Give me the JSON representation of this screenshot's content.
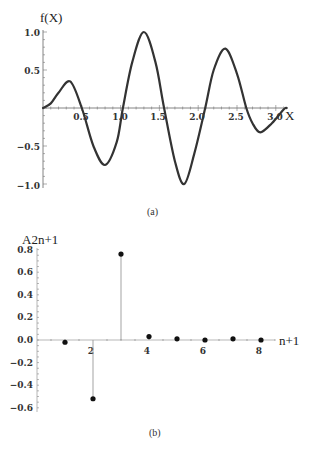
{
  "chart_data": [
    {
      "type": "line",
      "panel": "(a)",
      "title": "",
      "ylabel": "f(X)",
      "xlabel": "X",
      "xlim": [
        0,
        3.14
      ],
      "ylim": [
        -1.0,
        1.0
      ],
      "xticks": [
        "0.5",
        "1.0",
        "1.5",
        "2.0",
        "2.5",
        "3.0"
      ],
      "yticks": [
        "1.0",
        "0.5",
        "-0.5",
        "-1.0"
      ],
      "grid": false,
      "series": [
        {
          "name": "f(X)",
          "x": [
            0,
            0.1,
            0.2,
            0.35,
            0.5,
            0.65,
            0.8,
            0.95,
            1.03,
            1.15,
            1.3,
            1.45,
            1.56,
            1.7,
            1.82,
            1.95,
            2.09,
            2.2,
            2.35,
            2.5,
            2.62,
            2.7,
            2.8,
            2.95,
            3.1,
            3.14
          ],
          "y": [
            0,
            0.06,
            0.2,
            0.35,
            0.0,
            -0.5,
            -0.75,
            -0.45,
            0.0,
            0.6,
            1.0,
            0.6,
            0.0,
            -0.7,
            -1.0,
            -0.6,
            0.0,
            0.5,
            0.78,
            0.45,
            0.0,
            -0.2,
            -0.32,
            -0.2,
            -0.02,
            0.0
          ]
        }
      ]
    },
    {
      "type": "scatter",
      "style": "stem",
      "panel": "(b)",
      "title": "",
      "ylabel": "A2n+1",
      "xlabel": "n+1",
      "xlim": [
        0,
        9
      ],
      "ylim": [
        -0.6,
        0.8
      ],
      "xticks": [
        "2",
        "4",
        "6",
        "8"
      ],
      "yticks": [
        "0.8",
        "0.6",
        "0.4",
        "0.2",
        "0.0",
        "-0.2",
        "-0.4",
        "-0.6"
      ],
      "grid": false,
      "series": [
        {
          "name": "A2n+1",
          "x": [
            1,
            2,
            3,
            4,
            5,
            6,
            7,
            8
          ],
          "y": [
            -0.02,
            -0.52,
            0.76,
            0.03,
            0.01,
            0.0,
            0.01,
            0.0
          ]
        }
      ]
    }
  ],
  "captions": {
    "a": "(a)",
    "b": "(b)"
  },
  "labels": {
    "a_y": "f(X)",
    "a_x": "X",
    "b_y": "A2n+1",
    "b_x": "n+1"
  },
  "ticks": {
    "a_x": [
      "0.5",
      "1.0",
      "1.5",
      "2.0",
      "2.5",
      "3.0"
    ],
    "a_y": [
      "1.0",
      "0.5",
      "−0.5",
      "−1.0"
    ],
    "b_x": [
      "2",
      "4",
      "6",
      "8"
    ],
    "b_y": [
      "0.8",
      "0.6",
      "0.4",
      "0.2",
      "0.0",
      "−0.2",
      "−0.4",
      "−0.6"
    ]
  }
}
